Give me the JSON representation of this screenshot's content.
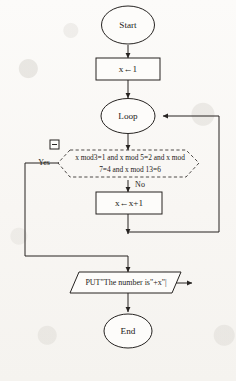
{
  "figure": {
    "caption": "(b) 流程图",
    "type": "flowchart"
  },
  "nodes": {
    "start": {
      "label": "Start",
      "shape": "terminator-ellipse"
    },
    "init": {
      "label": "x←1",
      "shape": "process-rectangle"
    },
    "loop": {
      "label": "Loop",
      "shape": "loop-ellipse"
    },
    "decision": {
      "shape": "decision-hexagon-dashed",
      "line1": "x mod3=1 and x mod 5=2 and x mod",
      "line2": "7=4 and x mod 13=6",
      "collapse_widget": "⊟"
    },
    "increment": {
      "label": "x←x+1",
      "shape": "process-rectangle"
    },
    "output": {
      "label": "PUT\"The number is\"+x\"|",
      "shape": "io-parallelogram"
    },
    "end": {
      "label": "End",
      "shape": "terminator-ellipse"
    }
  },
  "branches": {
    "yes": "Yes",
    "no": "No"
  }
}
